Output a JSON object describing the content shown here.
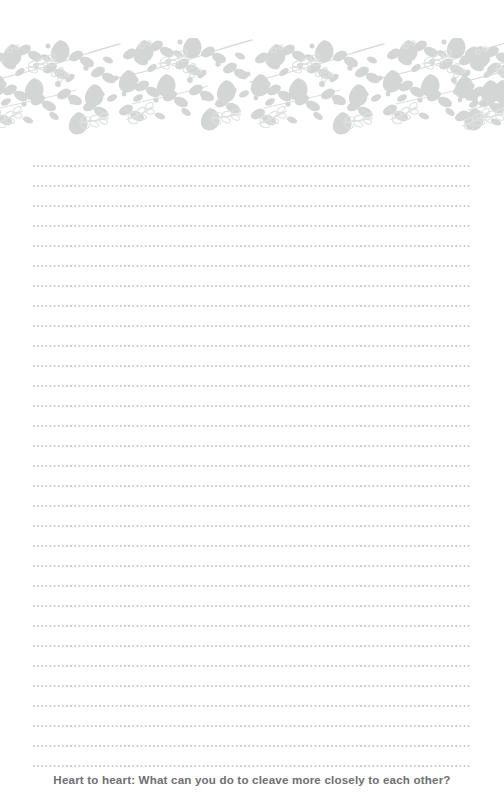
{
  "page": {
    "kind": "journal-page",
    "background_color": "#ffffff",
    "width": 504,
    "height": 811
  },
  "header_ornament": {
    "name": "floral-border-band",
    "description": "Botanical vine border with leaves, teardrop petals, berries and outlined sprigs",
    "fill_color": "#d4d6d6",
    "outline_color": "#dfe1e1",
    "stem_color": "#d9dbdb",
    "top": 38,
    "height": 98
  },
  "ruled_lines": {
    "name": "dotted-writing-lines",
    "count": 31,
    "spacing_px": 20,
    "first_line_y": 165,
    "left_x": 33,
    "right_x": 472,
    "dot_color": "#c9cbcd"
  },
  "footer": {
    "prompt": "Heart to heart: What can you do to cleave more closely to each other?",
    "text_color": "#6e6f73"
  }
}
